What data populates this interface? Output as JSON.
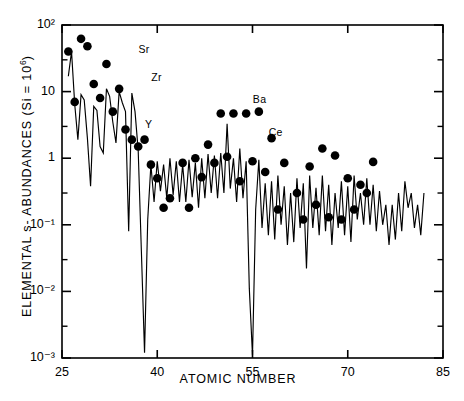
{
  "figure": {
    "title": "",
    "axis_title_y_prefix": "ELEMENTAL  s- ABUNDANCES  (Si = 10",
    "axis_title_y_sup": "6",
    "axis_title_y_suffix": ")",
    "axis_title_x": "ATOMIC  NUMBER"
  },
  "chart_data": {
    "type": "line",
    "title": "",
    "xlabel": "ATOMIC  NUMBER",
    "ylabel": "ELEMENTAL s- ABUNDANCES (Si = 10^6)",
    "xlim": [
      25,
      85
    ],
    "ylim": [
      0.001,
      100
    ],
    "yscale": "log",
    "xscale": "linear",
    "grid": false,
    "legend": null,
    "xticks": [
      25,
      40,
      55,
      70,
      85
    ],
    "xtick_labels": [
      "25",
      "40",
      "55",
      "70",
      "85"
    ],
    "yticks": [
      0.001,
      0.01,
      0.1,
      1,
      10,
      100
    ],
    "ytick_labels": [
      "10^-3",
      "10^-2",
      "10^-1",
      "1",
      "10",
      "10^2"
    ],
    "ytick_label_display": [
      "10⁻³",
      "10⁻²",
      "10⁻¹",
      "1",
      "10",
      "10²"
    ],
    "minor_yticks": [
      0.003,
      0.03,
      0.3,
      3,
      30
    ],
    "annotations": [
      {
        "text": "Sr",
        "x": 38,
        "y": 42
      },
      {
        "text": "Zr",
        "x": 40,
        "y": 16
      },
      {
        "text": "Y",
        "x": 39,
        "y": 3.2
      },
      {
        "text": "Ba",
        "x": 56,
        "y": 7.5
      },
      {
        "text": "Ce",
        "x": 58.5,
        "y": 2.4
      }
    ],
    "series": [
      {
        "name": "isotopic s-abundance distribution",
        "style": "line",
        "x": [
          26,
          26.5,
          27,
          27.5,
          28,
          28.5,
          29,
          29.5,
          30,
          30.5,
          31,
          31.5,
          32,
          32.5,
          33,
          33.5,
          34,
          34.5,
          35,
          35.5,
          36,
          36.5,
          37,
          37.5,
          38,
          38.5,
          39,
          39.5,
          40,
          40.5,
          41,
          41.5,
          42,
          42.5,
          43,
          43.5,
          44,
          44.5,
          45,
          45.5,
          46,
          46.5,
          47,
          47.5,
          48,
          48.5,
          49,
          49.5,
          50,
          50.5,
          51,
          51.5,
          52,
          52.5,
          53,
          53.5,
          54,
          54.5,
          55,
          55.5,
          56,
          56.5,
          57,
          57.5,
          58,
          58.5,
          59,
          59.5,
          60,
          60.5,
          61,
          61.5,
          62,
          62.5,
          63,
          63.5,
          64,
          64.5,
          65,
          65.5,
          66,
          66.5,
          67,
          67.5,
          68,
          68.5,
          69,
          69.5,
          70,
          70.5,
          71,
          71.5,
          72,
          72.5,
          73,
          73.5,
          74,
          74.5,
          75,
          75.5,
          76,
          76.5,
          77,
          77.5,
          78,
          78.5,
          79,
          79.5,
          80,
          80.5,
          81,
          81.5,
          82
        ],
        "y": [
          17,
          40,
          6.5,
          1.9,
          9.0,
          7.5,
          2.0,
          0.38,
          6.0,
          5.2,
          1.5,
          1.2,
          11.0,
          8.5,
          3.5,
          1.7,
          10.0,
          6.8,
          5.0,
          0.08,
          9.5,
          5.0,
          1.3,
          0.04,
          0.0012,
          0.12,
          0.8,
          0.22,
          0.9,
          0.32,
          0.8,
          0.25,
          1.0,
          0.28,
          0.9,
          0.22,
          0.8,
          0.22,
          0.95,
          0.26,
          0.85,
          0.18,
          1.0,
          0.25,
          1.15,
          0.3,
          1.1,
          0.25,
          1.2,
          0.3,
          3.3,
          0.35,
          1.0,
          0.22,
          1.4,
          0.25,
          0.9,
          0.011,
          0.0011,
          0.17,
          0.95,
          0.09,
          0.42,
          0.07,
          0.45,
          0.06,
          0.55,
          0.1,
          0.38,
          0.05,
          0.3,
          0.055,
          0.5,
          0.09,
          0.42,
          0.022,
          0.55,
          0.09,
          0.36,
          0.07,
          0.55,
          0.08,
          0.4,
          0.05,
          0.3,
          0.09,
          0.45,
          0.07,
          0.38,
          0.055,
          0.55,
          0.12,
          0.3,
          0.1,
          0.5,
          0.1,
          0.4,
          0.08,
          0.32,
          0.1,
          0.2,
          0.05,
          0.2,
          0.06,
          0.3,
          0.08,
          0.45,
          0.18,
          0.3,
          0.09,
          0.2,
          0.07,
          0.3
        ]
      },
      {
        "name": "elemental s-abundances",
        "style": "points",
        "x": [
          26,
          27,
          28,
          29,
          30,
          31,
          32,
          33,
          34,
          35,
          36,
          37,
          38,
          39,
          40,
          41,
          42,
          44,
          45,
          46,
          47,
          48,
          49,
          50,
          51,
          52,
          53,
          54,
          55,
          56,
          57,
          58,
          59,
          60,
          62,
          63,
          64,
          65,
          66,
          67,
          68,
          69,
          70,
          71,
          72,
          73,
          74
        ],
        "y": [
          40,
          7.0,
          62,
          48,
          13,
          8.0,
          26,
          5.0,
          11.0,
          2.7,
          1.9,
          1.5,
          1.9,
          0.8,
          0.5,
          0.18,
          0.25,
          0.85,
          0.18,
          1.0,
          0.52,
          1.6,
          0.85,
          4.7,
          1.05,
          4.7,
          0.45,
          4.7,
          0.9,
          5.0,
          0.62,
          2.0,
          0.17,
          0.85,
          0.3,
          0.12,
          0.75,
          0.2,
          1.4,
          0.13,
          1.1,
          0.12,
          0.5,
          0.17,
          0.4,
          0.3,
          0.88
        ]
      }
    ]
  }
}
